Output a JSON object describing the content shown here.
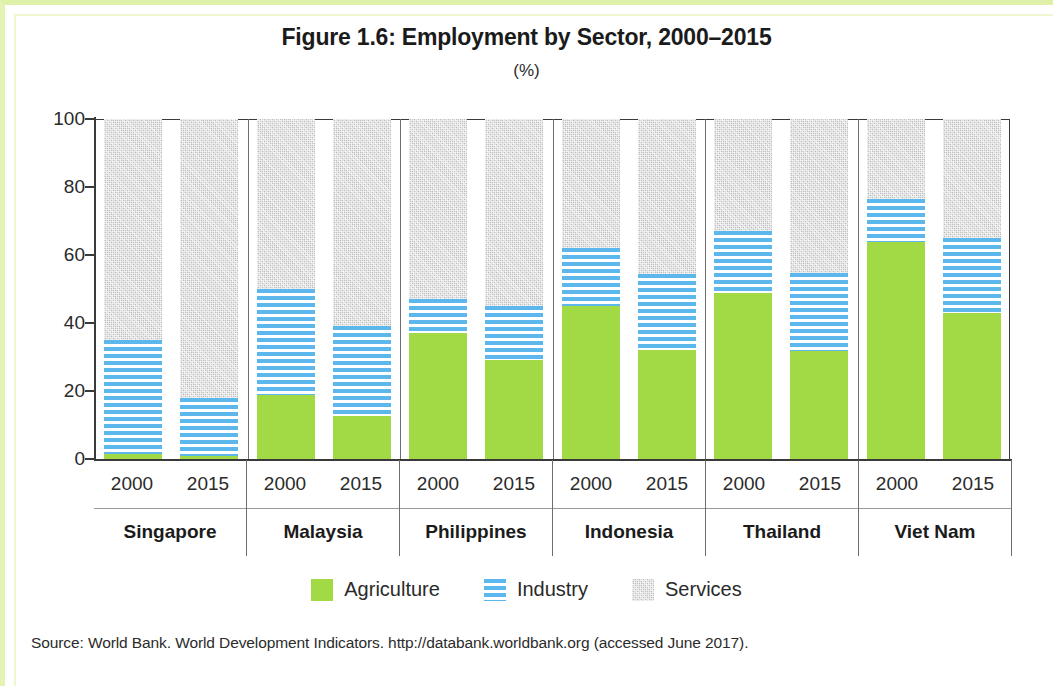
{
  "title": "Figure 1.6: Employment by Sector, 2000–2015",
  "subtitle": "(%)",
  "source": "Source: World Bank. World Development Indicators. http://databank.worldbank.org (accessed June 2017).",
  "legend": {
    "items": [
      {
        "label": "Agriculture",
        "icon": "solid-green-square-icon",
        "color": "#a2da45"
      },
      {
        "label": "Industry",
        "icon": "blue-striped-square-icon",
        "color": "#5cb8ec"
      },
      {
        "label": "Services",
        "icon": "gray-speckled-square-icon",
        "color": "#c8c8c8"
      }
    ]
  },
  "axis": {
    "y_ticks": [
      "0",
      "20",
      "40",
      "60",
      "80",
      "100"
    ]
  },
  "chart_data": {
    "type": "bar",
    "stacked": true,
    "title": "Figure 1.6: Employment by Sector, 2000–2015",
    "subtitle": "(%)",
    "xlabel": "",
    "ylabel": "%",
    "ylim": [
      0,
      100
    ],
    "yticks": [
      0,
      20,
      40,
      60,
      80,
      100
    ],
    "grid": false,
    "legend_position": "bottom",
    "categories": [
      "Singapore 2000",
      "Singapore 2015",
      "Malaysia 2000",
      "Malaysia 2015",
      "Philippines 2000",
      "Philippines 2015",
      "Indonesia 2000",
      "Indonesia 2015",
      "Thailand 2000",
      "Thailand 2015",
      "Viet Nam 2000",
      "Viet Nam 2015"
    ],
    "series": [
      {
        "name": "Agriculture",
        "color": "#a2da45",
        "values": [
          1.5,
          1.0,
          18.7,
          12.5,
          37.1,
          29.0,
          45.1,
          32.2,
          48.8,
          31.7,
          63.8,
          43.0
        ]
      },
      {
        "name": "Industry",
        "color": "#5cb8ec",
        "values": [
          33.5,
          16.9,
          31.3,
          26.5,
          9.9,
          16.0,
          17.1,
          22.3,
          18.2,
          23.1,
          12.7,
          22.0
        ]
      },
      {
        "name": "Services",
        "color": "#c8c8c8",
        "values": [
          65.0,
          82.1,
          50.0,
          61.0,
          53.0,
          55.0,
          37.8,
          45.5,
          33.0,
          45.2,
          23.5,
          35.0
        ]
      }
    ],
    "groups": [
      {
        "name": "Singapore",
        "bars": [
          {
            "year": "2000",
            "agriculture": 1.5,
            "industry": 33.5,
            "services": 65.0
          },
          {
            "year": "2015",
            "agriculture": 1.0,
            "industry": 16.9,
            "services": 82.1
          }
        ]
      },
      {
        "name": "Malaysia",
        "bars": [
          {
            "year": "2000",
            "agriculture": 18.7,
            "industry": 31.3,
            "services": 50.0
          },
          {
            "year": "2015",
            "agriculture": 12.5,
            "industry": 26.5,
            "services": 61.0
          }
        ]
      },
      {
        "name": "Philippines",
        "bars": [
          {
            "year": "2000",
            "agriculture": 37.1,
            "industry": 9.9,
            "services": 53.0
          },
          {
            "year": "2015",
            "agriculture": 29.0,
            "industry": 16.0,
            "services": 55.0
          }
        ]
      },
      {
        "name": "Indonesia",
        "bars": [
          {
            "year": "2000",
            "agriculture": 45.1,
            "industry": 17.1,
            "services": 37.8
          },
          {
            "year": "2015",
            "agriculture": 32.2,
            "industry": 22.3,
            "services": 45.5
          }
        ]
      },
      {
        "name": "Thailand",
        "bars": [
          {
            "year": "2000",
            "agriculture": 48.8,
            "industry": 18.2,
            "services": 33.0
          },
          {
            "year": "2015",
            "agriculture": 31.7,
            "industry": 23.1,
            "services": 45.2
          }
        ]
      },
      {
        "name": "Viet Nam",
        "bars": [
          {
            "year": "2000",
            "agriculture": 63.8,
            "industry": 12.7,
            "services": 23.5
          },
          {
            "year": "2015",
            "agriculture": 43.0,
            "industry": 22.0,
            "services": 35.0
          }
        ]
      }
    ]
  }
}
